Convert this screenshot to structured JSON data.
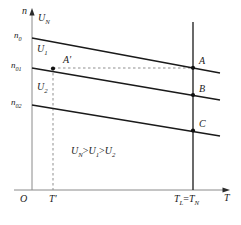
{
  "figure": {
    "kind": "line-diagram",
    "axes": {
      "y_label": "n",
      "x_label": "T",
      "origin_label": "O"
    },
    "y_ticks": [
      {
        "id": "n0",
        "base": "n",
        "sub": "0",
        "y": 38
      },
      {
        "id": "n01",
        "base": "n",
        "sub": "01",
        "y": 68
      },
      {
        "id": "n02",
        "base": "n",
        "sub": "02",
        "y": 105
      }
    ],
    "x_ticks": [
      {
        "id": "Tprime",
        "base": "T",
        "sub": "′",
        "x": 53
      },
      {
        "id": "TL_TN",
        "text": "T_L = T_N",
        "x": 193
      }
    ],
    "curves": [
      {
        "id": "UN",
        "base": "U",
        "sub": "N",
        "label_x": 40,
        "label_y": 16
      },
      {
        "id": "U1",
        "base": "U",
        "sub": "1",
        "label_x": 38,
        "label_y": 48
      },
      {
        "id": "U2",
        "base": "U",
        "sub": "2",
        "label_x": 38,
        "label_y": 86
      }
    ],
    "points": [
      {
        "id": "A",
        "label": "A",
        "x": 193,
        "y": 68
      },
      {
        "id": "B",
        "label": "B",
        "x": 193,
        "y": 95
      },
      {
        "id": "C",
        "label": "C",
        "x": 193,
        "y": 130
      },
      {
        "id": "Aprime",
        "label": "A′",
        "x": 53,
        "y": 68
      }
    ],
    "inequality": {
      "terms": [
        "U",
        "U",
        "U"
      ],
      "subs": [
        "N",
        "1",
        "2"
      ],
      "operator": ">",
      "text": "U_N > U_1 > U_2"
    },
    "colors": {
      "line": "#1a1a1a",
      "dashed": "#808080",
      "axis": "#808080",
      "text": "#1a1a1a",
      "background": "#ffffff"
    }
  }
}
